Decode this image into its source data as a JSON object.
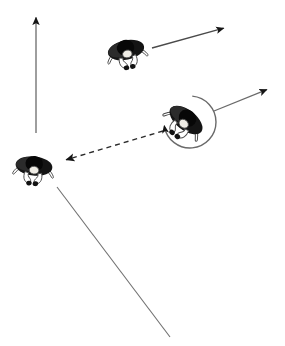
{
  "figure": {
    "title": "Top-down diagram of three seated people with motion arrows",
    "canvas": {
      "width": 285,
      "height": 346,
      "background": "#ffffff"
    },
    "colors": {
      "ink": "#1a1a1a",
      "line": "#6f6f6f",
      "hair": "#111111",
      "skin": "#f2efe9",
      "outline": "#3a3a3a",
      "background": "#ffffff"
    }
  },
  "people": [
    {
      "id": "person-top",
      "label": "person-top-center",
      "position": {
        "x": 126,
        "y": 50
      },
      "rotation_deg": -12,
      "scale": 1.0
    },
    {
      "id": "person-right",
      "label": "person-right-rotating",
      "position": {
        "x": 186,
        "y": 120
      },
      "rotation_deg": 38,
      "scale": 1.05
    },
    {
      "id": "person-left",
      "label": "person-left-lower",
      "position": {
        "x": 34,
        "y": 166
      },
      "rotation_deg": 6,
      "scale": 1.0
    }
  ],
  "arrows": [
    {
      "id": "arrow-vertical-up",
      "label": "upward-arrow",
      "style": "solid",
      "head": "end",
      "from": {
        "x": 36,
        "y": 133
      },
      "to": {
        "x": 36,
        "y": 13
      }
    },
    {
      "id": "arrow-top-right",
      "label": "top-person-heading-arrow",
      "style": "solid",
      "head": "end",
      "from": {
        "x": 152,
        "y": 48
      },
      "to": {
        "x": 228,
        "y": 27
      }
    },
    {
      "id": "arrow-mid-right",
      "label": "right-person-heading-arrow",
      "style": "solid",
      "head": "end",
      "from": {
        "x": 214,
        "y": 111
      },
      "to": {
        "x": 271,
        "y": 88
      }
    },
    {
      "id": "arrow-dashed-left",
      "label": "dashed-gaze-arrow",
      "style": "dashed",
      "head": "start",
      "from": {
        "x": 163,
        "y": 131
      },
      "to": {
        "x": 62,
        "y": 161
      }
    }
  ],
  "arcs": [
    {
      "id": "arc-rotation",
      "label": "rotation-arc-around-right-person",
      "center": {
        "x": 190,
        "y": 122
      },
      "radius": 26,
      "start_deg": -85,
      "sweep_deg": 255,
      "head": "end",
      "direction": "clockwise"
    }
  ],
  "lines": [
    {
      "id": "line-diagonal",
      "label": "long-diagonal-reference-line",
      "style": "solid",
      "head": "none",
      "from": {
        "x": 57,
        "y": 187
      },
      "to": {
        "x": 170,
        "y": 337
      }
    }
  ],
  "chart_data": {
    "type": "diagram",
    "title": "",
    "elements": 8,
    "people_count": 3,
    "arrow_count": 4,
    "arc_count": 1,
    "line_count": 1
  }
}
